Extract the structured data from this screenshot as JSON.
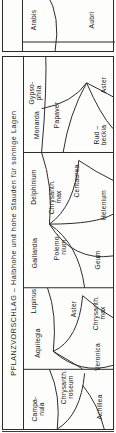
{
  "document": {
    "title": "PFLANZVORSCHLAG – Halbhohe und hohe Stauden für sonnige Lagen",
    "language": "de",
    "kind": "planting-plan"
  },
  "fragment_panel": {
    "name": "cut-off-plan-fragment-above",
    "labels": [
      {
        "id": "arabis",
        "text": "Arabis"
      },
      {
        "id": "aubrieta",
        "text": "Aubri"
      }
    ]
  },
  "plan": {
    "title_strip_label": "PFLANZVORSCHLAG – Halbhohe und hohe Stauden für sonnige Lagen",
    "zones": [
      {
        "id": "gypsophila",
        "text": "Gypso-\nphila"
      },
      {
        "id": "papaver",
        "text": "Papaver"
      },
      {
        "id": "aster-top",
        "text": "Aster"
      },
      {
        "id": "rudbeckia",
        "text": "Rud –\nbeckia"
      },
      {
        "id": "monarda",
        "text": "Monarda"
      },
      {
        "id": "centaurea",
        "text": "Centaurea"
      },
      {
        "id": "delphinium",
        "text": "Delphinium"
      },
      {
        "id": "chrysanthemum-max",
        "text": "Chrysanth.\nmax"
      },
      {
        "id": "helenium",
        "text": "Helenium"
      },
      {
        "id": "gaillardia",
        "text": "Gaillardia"
      },
      {
        "id": "polemonium",
        "text": "Polemo-\nnium"
      },
      {
        "id": "geum",
        "text": "Geum"
      },
      {
        "id": "lupinus",
        "text": "Lupinus"
      },
      {
        "id": "aster-mid",
        "text": "Aster"
      },
      {
        "id": "chrysanthemum-max-2",
        "text": "Chrysanth.\nmax"
      },
      {
        "id": "aquilegia",
        "text": "Aquilegia"
      },
      {
        "id": "chrysanthemum-roseum",
        "text": "Chrysanth.\nroseum"
      },
      {
        "id": "veronica",
        "text": "Veronica"
      },
      {
        "id": "campanula",
        "text": "Campa-\nnula"
      },
      {
        "id": "achillea",
        "text": "Achillea"
      }
    ]
  },
  "colors": {
    "ink": "#1c1c1c",
    "line": "#2b2b2b",
    "paper": "#fdfdfb"
  }
}
